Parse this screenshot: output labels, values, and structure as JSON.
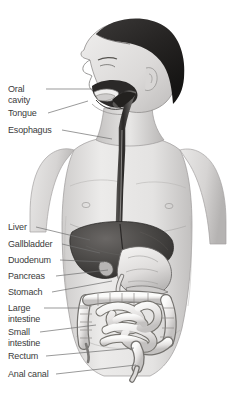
{
  "figure": {
    "view": "grayscale medical illustration",
    "background_color": "#ffffff",
    "ink_color": "#3b3b3b",
    "leader_line_color": "#6e6e6e",
    "skin_light": "#e8e7e6",
    "skin_mid": "#c9c7c6",
    "skin_shadow": "#a9a7a6",
    "hair_color": "#2d2b2a",
    "liver_color": "#4a4846",
    "organ_light": "#efeeed",
    "organ_outline": "#6a6866"
  },
  "labels": [
    {
      "id": "oral-cavity",
      "text": "Oral\ncavity",
      "x": 8,
      "y": 84,
      "line": {
        "x1": 46,
        "y1": 89,
        "x2": 92,
        "y2": 89
      }
    },
    {
      "id": "tongue",
      "text": "Tongue",
      "x": 8,
      "y": 108,
      "line": {
        "x1": 48,
        "y1": 113,
        "x2": 88,
        "y2": 101
      }
    },
    {
      "id": "esophagus",
      "text": "Esophagus",
      "x": 8,
      "y": 125,
      "line": {
        "x1": 62,
        "y1": 130,
        "x2": 112,
        "y2": 139
      }
    },
    {
      "id": "liver",
      "text": "Liver",
      "x": 8,
      "y": 222,
      "line": {
        "x1": 36,
        "y1": 227,
        "x2": 90,
        "y2": 240
      }
    },
    {
      "id": "gallbladder",
      "text": "Gallbladder",
      "x": 8,
      "y": 239,
      "line": {
        "x1": 62,
        "y1": 244,
        "x2": 100,
        "y2": 253
      }
    },
    {
      "id": "duodenum",
      "text": "Duodenum",
      "x": 8,
      "y": 255,
      "line": {
        "x1": 60,
        "y1": 260,
        "x2": 104,
        "y2": 262
      }
    },
    {
      "id": "pancreas",
      "text": "Pancreas",
      "x": 8,
      "y": 271,
      "line": {
        "x1": 56,
        "y1": 276,
        "x2": 108,
        "y2": 270
      }
    },
    {
      "id": "stomach",
      "text": "Stomach",
      "x": 8,
      "y": 287,
      "line": {
        "x1": 52,
        "y1": 292,
        "x2": 112,
        "y2": 281
      }
    },
    {
      "id": "large-intestine",
      "text": "Large\nintestine",
      "x": 8,
      "y": 303,
      "line": {
        "x1": 44,
        "y1": 308,
        "x2": 88,
        "y2": 308
      }
    },
    {
      "id": "small-intestine",
      "text": "Small\nintestine",
      "x": 8,
      "y": 327,
      "line": {
        "x1": 40,
        "y1": 332,
        "x2": 96,
        "y2": 325
      }
    },
    {
      "id": "rectum",
      "text": "Rectum",
      "x": 8,
      "y": 351,
      "line": {
        "x1": 46,
        "y1": 356,
        "x2": 134,
        "y2": 348
      }
    },
    {
      "id": "anal-canal",
      "text": "Anal canal",
      "x": 8,
      "y": 369,
      "line": {
        "x1": 56,
        "y1": 374,
        "x2": 136,
        "y2": 365
      }
    }
  ]
}
